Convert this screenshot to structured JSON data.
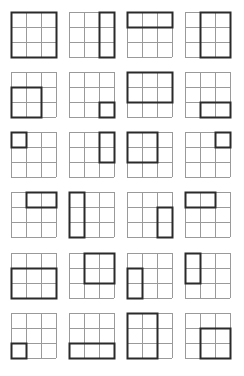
{
  "title": "",
  "grid_size": 3,
  "colors": {
    "grid_line": "#9a9a9a",
    "highlight": "#2a2a2a",
    "background": "#ffffff"
  },
  "panels": [
    {
      "row": 0,
      "col": 0,
      "highlight": {
        "r": 0,
        "c": 0,
        "rs": 3,
        "cs": 3
      }
    },
    {
      "row": 0,
      "col": 1,
      "highlight": {
        "r": 0,
        "c": 2,
        "rs": 3,
        "cs": 1
      }
    },
    {
      "row": 0,
      "col": 2,
      "highlight": {
        "r": 0,
        "c": 0,
        "rs": 1,
        "cs": 3
      }
    },
    {
      "row": 0,
      "col": 3,
      "highlight": {
        "r": 0,
        "c": 1,
        "rs": 3,
        "cs": 2
      }
    },
    {
      "row": 1,
      "col": 0,
      "highlight": {
        "r": 1,
        "c": 0,
        "rs": 2,
        "cs": 2
      }
    },
    {
      "row": 1,
      "col": 1,
      "highlight": {
        "r": 2,
        "c": 2,
        "rs": 1,
        "cs": 1
      }
    },
    {
      "row": 1,
      "col": 2,
      "highlight": {
        "r": 0,
        "c": 0,
        "rs": 2,
        "cs": 3
      }
    },
    {
      "row": 1,
      "col": 3,
      "highlight": {
        "r": 2,
        "c": 1,
        "rs": 1,
        "cs": 2
      }
    },
    {
      "row": 2,
      "col": 0,
      "highlight": {
        "r": 0,
        "c": 0,
        "rs": 1,
        "cs": 1
      }
    },
    {
      "row": 2,
      "col": 1,
      "highlight": {
        "r": 0,
        "c": 2,
        "rs": 2,
        "cs": 1
      }
    },
    {
      "row": 2,
      "col": 2,
      "highlight": {
        "r": 0,
        "c": 0,
        "rs": 2,
        "cs": 2
      }
    },
    {
      "row": 2,
      "col": 3,
      "highlight": {
        "r": 0,
        "c": 2,
        "rs": 1,
        "cs": 1
      }
    },
    {
      "row": 3,
      "col": 0,
      "highlight": {
        "r": 0,
        "c": 1,
        "rs": 1,
        "cs": 2
      }
    },
    {
      "row": 3,
      "col": 1,
      "highlight": {
        "r": 0,
        "c": 0,
        "rs": 3,
        "cs": 1
      }
    },
    {
      "row": 3,
      "col": 2,
      "highlight": {
        "r": 1,
        "c": 2,
        "rs": 2,
        "cs": 1
      }
    },
    {
      "row": 3,
      "col": 3,
      "highlight": {
        "r": 0,
        "c": 0,
        "rs": 1,
        "cs": 2
      }
    },
    {
      "row": 4,
      "col": 0,
      "highlight": {
        "r": 1,
        "c": 0,
        "rs": 2,
        "cs": 3
      }
    },
    {
      "row": 4,
      "col": 1,
      "highlight": {
        "r": 0,
        "c": 1,
        "rs": 2,
        "cs": 2
      }
    },
    {
      "row": 4,
      "col": 2,
      "highlight": {
        "r": 1,
        "c": 0,
        "rs": 2,
        "cs": 1
      }
    },
    {
      "row": 4,
      "col": 3,
      "highlight": {
        "r": 0,
        "c": 0,
        "rs": 2,
        "cs": 1
      }
    },
    {
      "row": 5,
      "col": 0,
      "highlight": {
        "r": 2,
        "c": 0,
        "rs": 1,
        "cs": 1
      }
    },
    {
      "row": 5,
      "col": 1,
      "highlight": {
        "r": 2,
        "c": 0,
        "rs": 1,
        "cs": 3
      }
    },
    {
      "row": 5,
      "col": 2,
      "highlight": {
        "r": 0,
        "c": 0,
        "rs": 3,
        "cs": 2
      }
    },
    {
      "row": 5,
      "col": 3,
      "highlight": {
        "r": 1,
        "c": 1,
        "rs": 2,
        "cs": 2
      }
    }
  ]
}
